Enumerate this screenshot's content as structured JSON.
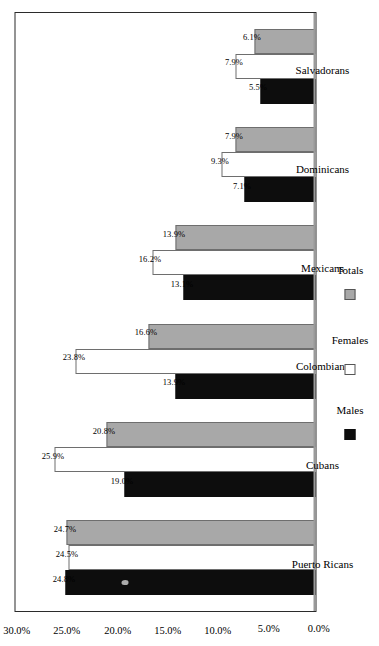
{
  "chart_data": {
    "type": "bar",
    "title": "",
    "xlabel": "",
    "ylabel": "",
    "ylim": [
      0,
      30
    ],
    "grid": false,
    "orientation": "vertical-columns-printed-sideways",
    "legend_position": "bottom-center",
    "categories": [
      "Puerto Ricans",
      "Cubans",
      "Colombians",
      "Mexicans",
      "Dominicans",
      "Salvadorans"
    ],
    "series": [
      {
        "name": "Males",
        "color": "#0d0d0d",
        "values": [
          24.8,
          19.0,
          13.9,
          13.1,
          7.1,
          5.5
        ]
      },
      {
        "name": "Females",
        "color": "#ffffff",
        "values": [
          24.5,
          25.9,
          23.8,
          16.2,
          9.3,
          7.9
        ]
      },
      {
        "name": "Totals",
        "color": "#a8a8a8",
        "values": [
          24.7,
          20.8,
          16.6,
          13.9,
          7.9,
          6.1
        ]
      }
    ],
    "data_labels": [
      {
        "category": "Puerto Ricans",
        "Males": "24.8%",
        "Females": "24.5%",
        "Totals": "24.7%"
      },
      {
        "category": "Cubans",
        "Males": "19.0%",
        "Females": "25.9%",
        "Totals": "20.8%"
      },
      {
        "category": "Colombians",
        "Males": "13.9%",
        "Females": "23.8%",
        "Totals": "16.6%"
      },
      {
        "category": "Mexicans",
        "Males": "13.1%",
        "Females": "16.2%",
        "Totals": "13.9%"
      },
      {
        "category": "Dominicans",
        "Males": "7.1%",
        "Females": "9.3%",
        "Totals": "7.9%"
      },
      {
        "category": "Salvadorans",
        "Males": "5.5%",
        "Females": "7.9%",
        "Totals": "6.1%"
      }
    ],
    "tick_labels": [
      "30.0%",
      "25.0%",
      "20.0%",
      "15.0%",
      "10.0%",
      "5.0%",
      "0.0%"
    ],
    "tick_values": [
      30,
      25,
      20,
      15,
      10,
      5,
      0
    ]
  },
  "legend": {
    "items": [
      {
        "label": "Males",
        "swatch": "males"
      },
      {
        "label": "Females",
        "swatch": "females"
      },
      {
        "label": "Totals",
        "swatch": "totals"
      }
    ]
  },
  "colors": {
    "males": "#0d0d0d",
    "females": "#ffffff",
    "totals": "#a8a8a8",
    "frame": "#2b2b2b",
    "background": "#ffffff"
  }
}
